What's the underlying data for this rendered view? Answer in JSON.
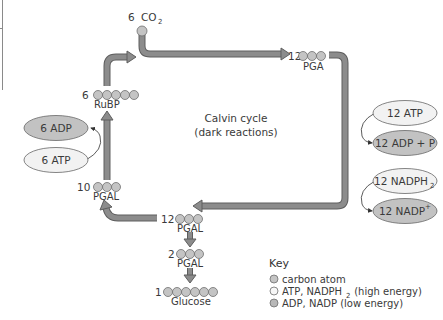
{
  "title": {
    "line1": "Calvin cycle",
    "line2": "(dark reactions)"
  },
  "colors": {
    "arrow_fill": "#8c8c8c",
    "arrow_stroke": "#5e5e5e",
    "carbon_fill": "#c4c4c4",
    "carbon_stroke": "#6e6e6e",
    "high_energy_fill": "#f2f2f2",
    "low_energy_fill": "#c2c2c2",
    "text": "#3a3a3a"
  },
  "molecules": {
    "co2": {
      "count": "6",
      "label": "CO",
      "subscript": "2",
      "carbons": 1
    },
    "pga": {
      "count": "12",
      "label": "PGA",
      "carbons": 3
    },
    "pgal_12": {
      "count": "12",
      "label": "PGAL",
      "carbons": 3
    },
    "pgal_10": {
      "count": "10",
      "label": "PGAL",
      "carbons": 3
    },
    "pgal_2": {
      "count": "2",
      "label": "PGAL",
      "carbons": 3
    },
    "rubp": {
      "count": "6",
      "label": "RuBP",
      "carbons": 5
    },
    "glucose": {
      "count": "1",
      "label": "Glucose",
      "carbons": 6
    }
  },
  "energy_carriers": {
    "atp_12": {
      "label": "12 ATP",
      "energy": "high"
    },
    "adp_12": {
      "label": "12 ADP + P",
      "energy": "low"
    },
    "nadph_12": {
      "label": "12 NADPH",
      "subscript": "2",
      "energy": "high"
    },
    "nadp_12": {
      "label": "12 NADP",
      "superscript": "+",
      "energy": "low"
    },
    "adp_6": {
      "label": "6 ADP",
      "energy": "low"
    },
    "atp_6": {
      "label": "6 ATP",
      "energy": "high"
    }
  },
  "key": {
    "title": "Key",
    "items": [
      {
        "symbol": "carbon-atom",
        "label": "carbon atom"
      },
      {
        "symbol": "high-energy",
        "label": "ATP, NADPH",
        "subscript": "2",
        "suffix": " (high energy)"
      },
      {
        "symbol": "low-energy",
        "label": "ADP, NADP (low energy)"
      }
    ]
  }
}
